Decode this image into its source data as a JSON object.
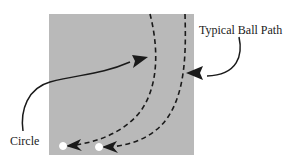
{
  "diagram": {
    "labels": {
      "ball_path": "Typical Ball Path",
      "circle": "Circle"
    },
    "colors": {
      "field": "#b9b9b9",
      "path_stroke": "#1a1a1a",
      "circle_fill": "#ffffff",
      "background": "#ffffff"
    },
    "field": {
      "x": 49,
      "y": 14,
      "width": 145,
      "height": 141
    },
    "paths": [
      {
        "name": "inner-path",
        "start": [
          150,
          14
        ],
        "end": [
          63,
          146
        ]
      },
      {
        "name": "outer-path",
        "start": [
          185,
          14
        ],
        "end": [
          99,
          147
        ]
      }
    ],
    "circles": [
      {
        "cx": 63,
        "cy": 146,
        "r": 3.5
      },
      {
        "cx": 99,
        "cy": 147,
        "r": 3.5
      }
    ]
  }
}
